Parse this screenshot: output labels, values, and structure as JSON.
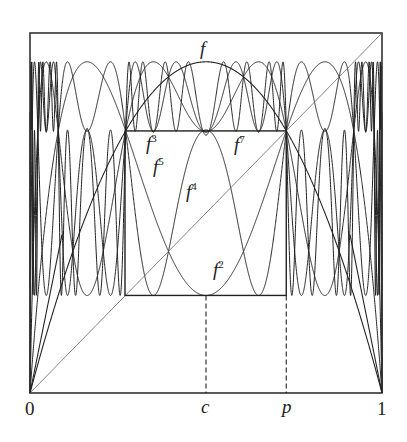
{
  "chart_data": {
    "type": "line",
    "title": "",
    "map": {
      "formula": "f(x) = r x (1 - x)",
      "r": 3.68
    },
    "iterates_plotted": [
      1,
      2,
      3,
      4,
      5,
      7
    ],
    "series": [
      {
        "name": "f",
        "label": "f",
        "iterate": 1
      },
      {
        "name": "f^2",
        "label": "f",
        "exp": "2",
        "iterate": 2
      },
      {
        "name": "f^3",
        "label": "f",
        "exp": "3",
        "iterate": 3
      },
      {
        "name": "f^4",
        "label": "f",
        "exp": "4",
        "iterate": 4
      },
      {
        "name": "f^5",
        "label": "f",
        "exp": "5",
        "iterate": 5
      },
      {
        "name": "f^7",
        "label": "f",
        "exp": "7",
        "iterate": 7
      },
      {
        "name": "diagonal",
        "label": "y = x",
        "style": "thin"
      }
    ],
    "xlim": [
      0,
      1
    ],
    "ylim": [
      0,
      1
    ],
    "x_tick_labels": [
      {
        "label": "0",
        "value": 0
      },
      {
        "label": "c",
        "value": 0.5
      },
      {
        "label": "p",
        "value": 0.728
      },
      {
        "label": "1",
        "value": 1
      }
    ],
    "annotations": {
      "inner_box": {
        "x0": 0.27,
        "x1": 0.728,
        "y0": 0.271,
        "y1": 0.728
      },
      "dashed_verticals": [
        0.5,
        0.728
      ],
      "trapezoid_lines": "from (0,0) and (1,0) to the bottom corners of the outer bands"
    },
    "xlabel": "",
    "ylabel": "",
    "grid": false,
    "legend": "inline labels"
  },
  "labels": {
    "f": "f",
    "f2_base": "f",
    "f2_exp": "2",
    "f3_base": "f",
    "f3_exp": "3",
    "f4_base": "f",
    "f4_exp": "4",
    "f5_base": "f",
    "f5_exp": "5",
    "f7_base": "f",
    "f7_exp": "7",
    "tick_0": "0",
    "tick_c": "c",
    "tick_p": "p",
    "tick_1": "1"
  },
  "style": {
    "ink": "#222222",
    "diagonal": "#555555"
  }
}
